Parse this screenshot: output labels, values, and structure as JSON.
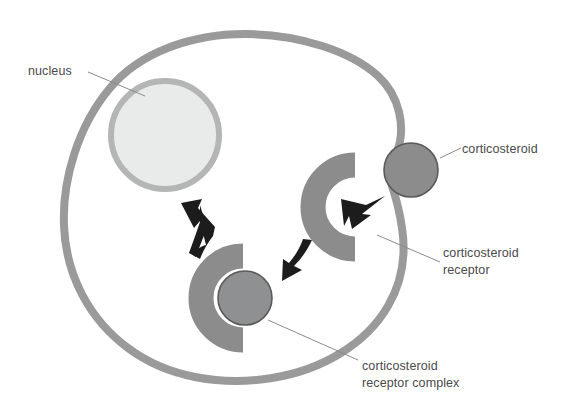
{
  "figure": {
    "type": "biological-diagram",
    "background_color": "#ffffff"
  },
  "colors": {
    "membrane": "#9a9a9a",
    "nucleus_fill": "#e9eaea",
    "nucleus_ring": "#b4b5b5",
    "steroid_fill": "#8c8c8c",
    "steroid_stroke": "#5a5a5a",
    "receptor_fill": "#8c8c8c",
    "arrow": "#1c1c1c",
    "leader_line": "#8a8a8a",
    "text": "#4a4a4a"
  },
  "labels": {
    "nucleus": "nucleus",
    "corticosteroid": "corticosteroid",
    "receptor_line1": "corticosteroid",
    "receptor_line2": "receptor",
    "complex_line1": "corticosteroid",
    "complex_line2": "receptor complex"
  },
  "shapes": {
    "cell_membrane": "irregular rounded cell outline",
    "nucleus": "large pale circle, upper left of cell",
    "corticosteroid": "small gray circle on the cell membrane at right",
    "corticosteroid_receptor": "gray C-shaped arc opening to the right, inside cell",
    "corticosteroid_receptor_complex": "gray C-shaped arc with gray circle bound inside"
  },
  "arrows": [
    {
      "name": "steroid-binds-receptor",
      "direction": "down-left",
      "note": "corticosteroid enters the receptor"
    },
    {
      "name": "complex-forms",
      "direction": "down-left",
      "note": "bound receptor moves into cytoplasm"
    },
    {
      "name": "complex-to-nucleus",
      "direction": "up-left",
      "note": "complex translocates to the nucleus"
    }
  ]
}
